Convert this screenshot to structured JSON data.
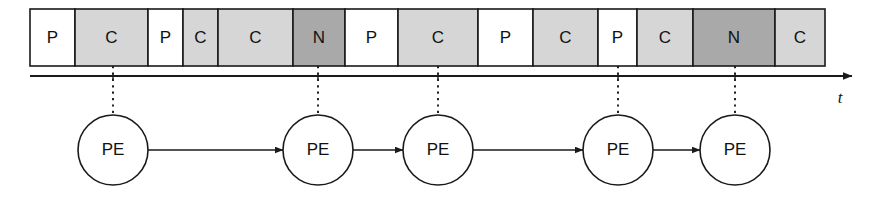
{
  "figure": {
    "name": "phase-timeline-with-pe-chain",
    "background_color": "#ffffff",
    "width": 881,
    "height": 198
  },
  "legend_colors": {
    "P": "#ffffff",
    "C": "#d6d6d6",
    "N": "#a9a9a9",
    "outline": "#1a1a1a",
    "text": "#111111"
  },
  "timeline": {
    "name": "phase-band",
    "x_start": 30,
    "x_end": 825,
    "y_top": 9,
    "y_bottom": 66,
    "cells": [
      {
        "label": "P",
        "x": 30,
        "width": 45,
        "fill": "#ffffff"
      },
      {
        "label": "C",
        "x": 75,
        "width": 73,
        "fill": "#d6d6d6"
      },
      {
        "label": "P",
        "x": 148,
        "width": 35,
        "fill": "#ffffff"
      },
      {
        "label": "C",
        "x": 183,
        "width": 35,
        "fill": "#d6d6d6"
      },
      {
        "label": "C",
        "x": 218,
        "width": 75,
        "fill": "#d6d6d6"
      },
      {
        "label": "N",
        "x": 293,
        "width": 52,
        "fill": "#a9a9a9"
      },
      {
        "label": "P",
        "x": 345,
        "width": 53,
        "fill": "#ffffff"
      },
      {
        "label": "C",
        "x": 398,
        "width": 80,
        "fill": "#d6d6d6"
      },
      {
        "label": "P",
        "x": 478,
        "width": 55,
        "fill": "#ffffff"
      },
      {
        "label": "C",
        "x": 533,
        "width": 65,
        "fill": "#d6d6d6"
      },
      {
        "label": "P",
        "x": 598,
        "width": 39,
        "fill": "#ffffff"
      },
      {
        "label": "C",
        "x": 637,
        "width": 56,
        "fill": "#d6d6d6"
      },
      {
        "label": "N",
        "x": 693,
        "width": 82,
        "fill": "#a9a9a9"
      },
      {
        "label": "C",
        "x": 775,
        "width": 50,
        "fill": "#d6d6d6"
      }
    ]
  },
  "time_axis": {
    "name": "time-axis",
    "y": 76,
    "x_start": 30,
    "x_end": 852,
    "label": "t",
    "label_x": 840,
    "label_y": 103,
    "ticks": [
      113,
      318,
      438,
      618,
      735
    ]
  },
  "drop_lines": {
    "name": "event-drop-lines",
    "y_top": 66,
    "y_bottom": 115,
    "x_positions": [
      113,
      318,
      438,
      618,
      735
    ]
  },
  "pe_chain": {
    "name": "pe-chain",
    "center_y": 150,
    "radius": 35,
    "label": "PE",
    "nodes": [
      {
        "cx": 113,
        "label": "PE"
      },
      {
        "cx": 318,
        "label": "PE"
      },
      {
        "cx": 438,
        "label": "PE"
      },
      {
        "cx": 618,
        "label": "PE"
      },
      {
        "cx": 735,
        "label": "PE"
      }
    ],
    "arrows": [
      {
        "from": 113,
        "to": 318
      },
      {
        "from": 318,
        "to": 438
      },
      {
        "from": 438,
        "to": 618
      },
      {
        "from": 618,
        "to": 735
      }
    ]
  }
}
